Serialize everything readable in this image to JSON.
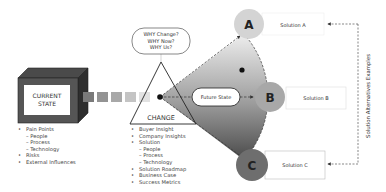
{
  "current_state": {
    "label_line1": "CURRENT",
    "label_line2": "STATE",
    "items": [
      {
        "text": "Pain Points",
        "level": 0
      },
      {
        "text": "People",
        "level": 1
      },
      {
        "text": "Process",
        "level": 1
      },
      {
        "text": "Technology",
        "level": 1
      },
      {
        "text": "Risks",
        "level": 0
      },
      {
        "text": "External Influences",
        "level": 0
      }
    ]
  },
  "why_bubble": {
    "line1": "WHY Change?",
    "line2": "WHY Now?",
    "line3": "WHY Us?"
  },
  "change": {
    "label": "CHANGE",
    "items": [
      {
        "text": "Buyer Insight",
        "level": 0
      },
      {
        "text": "Company  Insights",
        "level": 0
      },
      {
        "text": "Solution",
        "level": 0
      },
      {
        "text": "People",
        "level": 1
      },
      {
        "text": "Process",
        "level": 1
      },
      {
        "text": "Technology",
        "level": 1
      },
      {
        "text": "Solution Roadmap",
        "level": 0
      },
      {
        "text": "Business Case",
        "level": 0
      },
      {
        "text": "Success Metrics",
        "level": 0
      }
    ]
  },
  "future_state": {
    "label": "Future State"
  },
  "solutions": [
    {
      "letter": "A",
      "label": "Solution A",
      "color": "#d4d4d4"
    },
    {
      "letter": "B",
      "label": "Solution B",
      "color": "#a8a8a8"
    },
    {
      "letter": "C",
      "label": "Solution C",
      "color": "#6e6e6e"
    }
  ],
  "side_label": "Solution  Alternatives Examples",
  "colors": {
    "cube_front": "#555555",
    "cube_top": "#3e3e3e",
    "cube_side": "#2e2e2e",
    "square_1": "#7a7a7a",
    "square_2": "#9a9a9a",
    "square_3": "#b4b4b4",
    "square_4": "#dadada"
  }
}
